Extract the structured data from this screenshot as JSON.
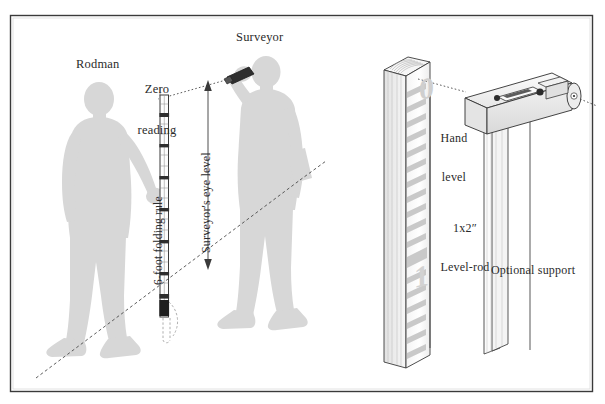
{
  "figure": {
    "frame_color": "#3a3a3a",
    "background_color": "#ffffff",
    "silhouette_color": "#d6d6d6",
    "line_color": "#3a3a3a",
    "rod_mark_color": "#c9c9c9"
  },
  "left_panel": {
    "labels": {
      "rodman": "Rodman",
      "zero_reading_line1": "Zero",
      "zero_reading_line2": "reading",
      "surveyor": "Surveyor",
      "folding_rule": "6-foot folding rule",
      "eye_level": "Surveyor's eye level"
    }
  },
  "right_panel": {
    "labels": {
      "hand_level_line1": "Hand",
      "hand_level_line2": "level",
      "level_rod_line1": "1x2″",
      "level_rod_line2": "Level-rod",
      "optional_support": "Optional support"
    },
    "rod_numbers": [
      "0",
      "1"
    ]
  }
}
